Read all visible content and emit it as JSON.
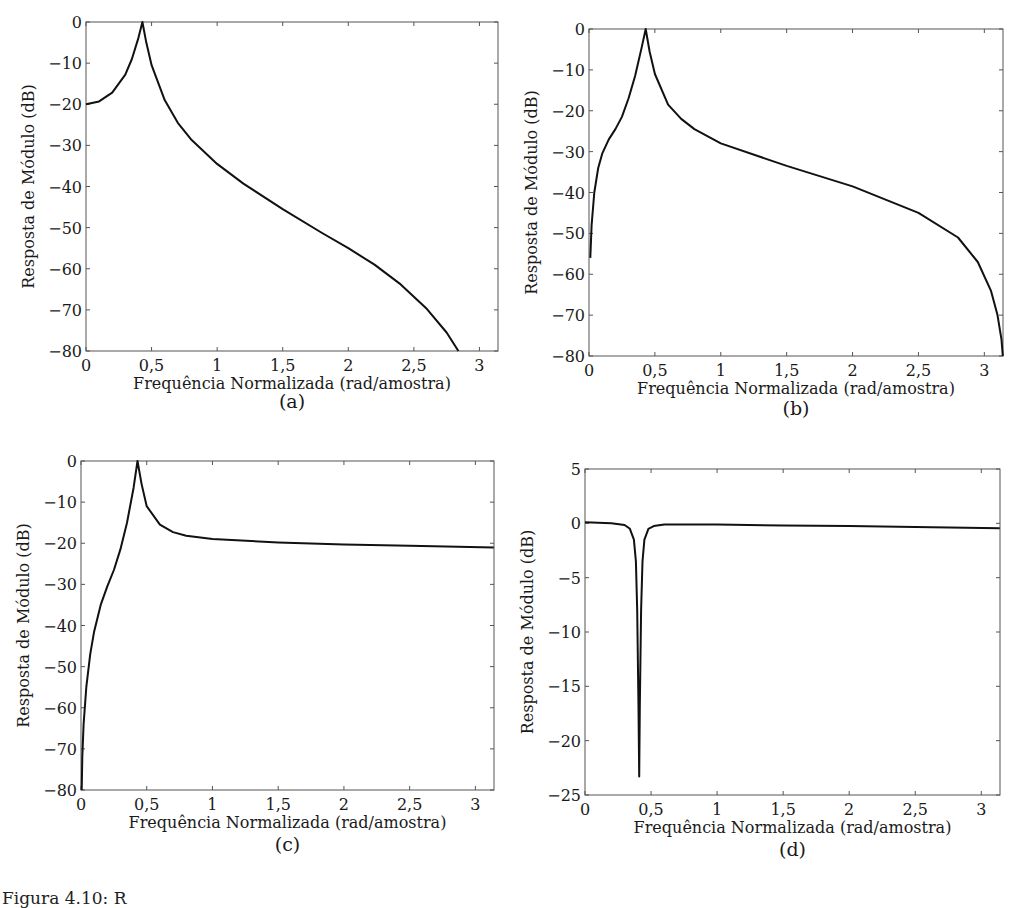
{
  "figure": {
    "caption_partial": "Figura 4.10: R",
    "panels": [
      {
        "id": "a",
        "label": "(a)"
      },
      {
        "id": "b",
        "label": "(b)"
      },
      {
        "id": "c",
        "label": "(c)"
      },
      {
        "id": "d",
        "label": "(d)"
      }
    ]
  },
  "chart_data": [
    {
      "panel": "(a)",
      "type": "line",
      "title": "",
      "xlabel": "Frequência Normalizada (rad/amostra)",
      "ylabel": "Resposta de Módulo (dB)",
      "xlim": [
        0,
        3.14159
      ],
      "ylim": [
        -80,
        0
      ],
      "xticks": [
        0,
        0.5,
        1,
        1.5,
        2,
        2.5,
        3
      ],
      "xtick_labels": [
        "0",
        "0,5",
        "1",
        "1,5",
        "2",
        "2,5",
        "3"
      ],
      "yticks": [
        0,
        -10,
        -20,
        -30,
        -40,
        -50,
        -60,
        -70,
        -80
      ],
      "ytick_labels": [
        "0",
        "−10",
        "−20",
        "−30",
        "−40",
        "−50",
        "−60",
        "−70",
        "−80"
      ],
      "grid": false,
      "series": [
        {
          "name": "H(a)",
          "color": "#111111",
          "x": [
            0,
            0.1,
            0.2,
            0.3,
            0.35,
            0.4,
            0.43,
            0.46,
            0.5,
            0.6,
            0.7,
            0.8,
            1.0,
            1.2,
            1.5,
            1.8,
            2.0,
            2.2,
            2.4,
            2.6,
            2.75,
            2.84
          ],
          "y": [
            -20,
            -19.3,
            -17.2,
            -12.8,
            -9.0,
            -3.8,
            0,
            -5.0,
            -10.5,
            -19.0,
            -24.5,
            -28.5,
            -34.5,
            -39.3,
            -45.5,
            -51.3,
            -55.0,
            -59.0,
            -63.8,
            -69.8,
            -75.5,
            -80
          ]
        }
      ]
    },
    {
      "panel": "(b)",
      "type": "line",
      "title": "",
      "xlabel": "Frequência Normalizada (rad/amostra)",
      "ylabel": "Resposta de Módulo (dB)",
      "xlim": [
        0,
        3.14159
      ],
      "ylim": [
        -80,
        0
      ],
      "xticks": [
        0,
        0.5,
        1,
        1.5,
        2,
        2.5,
        3
      ],
      "xtick_labels": [
        "0",
        "0,5",
        "1",
        "1,5",
        "2",
        "2,5",
        "3"
      ],
      "yticks": [
        0,
        -10,
        -20,
        -30,
        -40,
        -50,
        -60,
        -70,
        -80
      ],
      "ytick_labels": [
        "0",
        "−10",
        "−20",
        "−30",
        "−40",
        "−50",
        "−60",
        "−70",
        "−80"
      ],
      "grid": false,
      "series": [
        {
          "name": "H(b)",
          "color": "#111111",
          "x": [
            0.01,
            0.02,
            0.04,
            0.07,
            0.1,
            0.15,
            0.2,
            0.25,
            0.3,
            0.35,
            0.4,
            0.43,
            0.46,
            0.5,
            0.6,
            0.7,
            0.8,
            1.0,
            1.5,
            2.0,
            2.5,
            2.8,
            2.95,
            3.05,
            3.1,
            3.13,
            3.14
          ],
          "y": [
            -56,
            -48,
            -40,
            -34,
            -30.5,
            -27,
            -24.5,
            -21.5,
            -17,
            -11.5,
            -4.5,
            0,
            -5.5,
            -11,
            -18.5,
            -22,
            -24.5,
            -28,
            -33.5,
            -38.5,
            -45,
            -51,
            -57,
            -64,
            -70,
            -76,
            -80
          ]
        }
      ]
    },
    {
      "panel": "(c)",
      "type": "line",
      "title": "",
      "xlabel": "Frequência Normalizada (rad/amostra)",
      "ylabel": "Resposta de Módulo (dB)",
      "xlim": [
        0,
        3.14159
      ],
      "ylim": [
        -80,
        0
      ],
      "xticks": [
        0,
        0.5,
        1,
        1.5,
        2,
        2.5,
        3
      ],
      "xtick_labels": [
        "0",
        "0,5",
        "1",
        "1,5",
        "2",
        "2,5",
        "3"
      ],
      "yticks": [
        0,
        -10,
        -20,
        -30,
        -40,
        -50,
        -60,
        -70,
        -80
      ],
      "ytick_labels": [
        "0",
        "−10",
        "−20",
        "−30",
        "−40",
        "−50",
        "−60",
        "−70",
        "−80"
      ],
      "grid": false,
      "series": [
        {
          "name": "H(c)",
          "color": "#111111",
          "x": [
            0.005,
            0.01,
            0.02,
            0.04,
            0.07,
            0.1,
            0.15,
            0.2,
            0.25,
            0.3,
            0.35,
            0.4,
            0.43,
            0.46,
            0.5,
            0.6,
            0.7,
            0.8,
            1.0,
            1.5,
            2.0,
            2.5,
            3.14
          ],
          "y": [
            -80,
            -72,
            -64,
            -55,
            -47,
            -41.5,
            -35,
            -30.5,
            -26.5,
            -21.5,
            -15,
            -6.5,
            0,
            -5.5,
            -11,
            -15.5,
            -17.3,
            -18.2,
            -19.0,
            -19.8,
            -20.3,
            -20.6,
            -21.0
          ]
        }
      ]
    },
    {
      "panel": "(d)",
      "type": "line",
      "title": "",
      "xlabel": "Frequência Normalizada (rad/amostra)",
      "ylabel": "Resposta de Módulo (dB)",
      "xlim": [
        0,
        3.14159
      ],
      "ylim": [
        -25,
        5
      ],
      "xticks": [
        0,
        0.5,
        1,
        1.5,
        2,
        2.5,
        3
      ],
      "xtick_labels": [
        "0",
        "0,5",
        "1",
        "1,5",
        "2",
        "2,5",
        "3"
      ],
      "yticks": [
        5,
        0,
        -5,
        -10,
        -15,
        -20,
        -25
      ],
      "ytick_labels": [
        "5",
        "0",
        "−5",
        "−10",
        "−15",
        "−20",
        "−25"
      ],
      "grid": false,
      "series": [
        {
          "name": "H(d)",
          "color": "#111111",
          "x": [
            0,
            0.2,
            0.3,
            0.34,
            0.37,
            0.385,
            0.395,
            0.405,
            0.41,
            0.415,
            0.425,
            0.435,
            0.45,
            0.48,
            0.52,
            0.6,
            1.0,
            1.5,
            2.0,
            2.5,
            3.14
          ],
          "y": [
            0.1,
            0.0,
            -0.15,
            -0.5,
            -1.5,
            -3.5,
            -8,
            -17,
            -23.3,
            -17,
            -8,
            -3.5,
            -1.5,
            -0.5,
            -0.25,
            -0.1,
            -0.1,
            -0.2,
            -0.25,
            -0.35,
            -0.45
          ]
        }
      ]
    }
  ]
}
